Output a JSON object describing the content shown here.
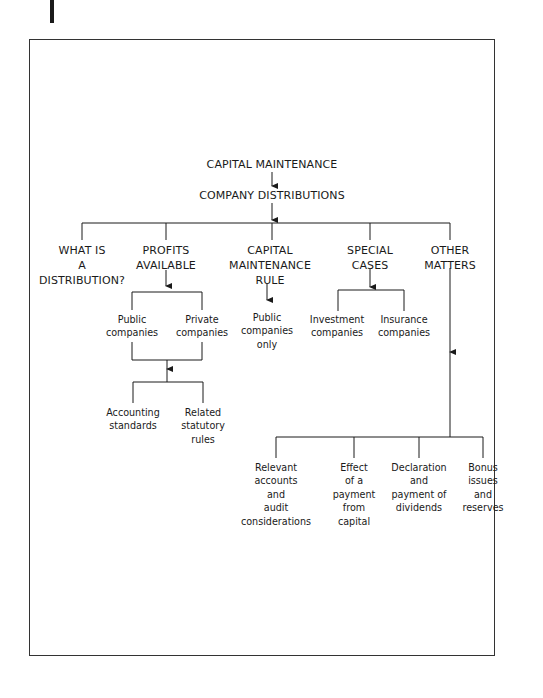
{
  "diagram": {
    "root": {
      "label": "CAPITAL MAINTENANCE"
    },
    "level1": {
      "label": "COMPANY DISTRIBUTIONS"
    },
    "branches": [
      {
        "id": "what-is-distribution",
        "lines": [
          "WHAT IS",
          "A",
          "DISTRIBUTION?"
        ]
      },
      {
        "id": "profits-available",
        "lines": [
          "PROFITS",
          "AVAILABLE"
        ],
        "children": [
          {
            "lines": [
              "Public",
              "companies"
            ]
          },
          {
            "lines": [
              "Private",
              "companies"
            ]
          }
        ],
        "grandchildren": [
          {
            "lines": [
              "Accounting",
              "standards"
            ]
          },
          {
            "lines": [
              "Related",
              "statutory",
              "rules"
            ]
          }
        ]
      },
      {
        "id": "capital-maintenance-rule",
        "lines": [
          "CAPITAL",
          "MAINTENANCE",
          "RULE"
        ],
        "children": [
          {
            "lines": [
              "Public",
              "companies",
              "only"
            ]
          }
        ]
      },
      {
        "id": "special-cases",
        "lines": [
          "SPECIAL",
          "CASES"
        ],
        "children": [
          {
            "lines": [
              "Investment",
              "companies"
            ]
          },
          {
            "lines": [
              "Insurance",
              "companies"
            ]
          }
        ]
      },
      {
        "id": "other-matters",
        "lines": [
          "OTHER",
          "MATTERS"
        ],
        "children": [
          {
            "lines": [
              "Relevant",
              "accounts",
              "and",
              "audit",
              "considerations"
            ]
          },
          {
            "lines": [
              "Effect",
              "of a",
              "payment",
              "from",
              "capital"
            ]
          },
          {
            "lines": [
              "Declaration",
              "and",
              "payment of",
              "dividends"
            ]
          },
          {
            "lines": [
              "Bonus",
              "issues",
              "and",
              "reserves"
            ]
          }
        ]
      }
    ]
  }
}
